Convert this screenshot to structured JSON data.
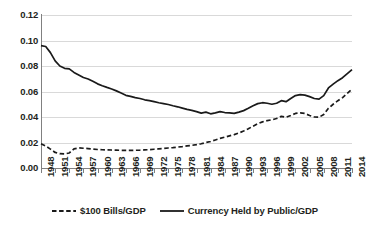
{
  "chart_data": {
    "type": "line",
    "title": "",
    "subtitle": "",
    "xlabel": "",
    "ylabel": "",
    "grid": true,
    "legend_position": "bottom",
    "xlim": [
      1948,
      2014
    ],
    "ylim": [
      0.0,
      0.12
    ],
    "ytick_labels": [
      "0.12",
      "0.10",
      "0.08",
      "0.06",
      "0.04",
      "0.02",
      "0.00"
    ],
    "ytick_values": [
      0.12,
      0.1,
      0.08,
      0.06,
      0.04,
      0.02,
      0.0
    ],
    "xtick_labels": [
      "1948",
      "1951",
      "1954",
      "1957",
      "1960",
      "1963",
      "1966",
      "1969",
      "1972",
      "1975",
      "1978",
      "1981",
      "1984",
      "1987",
      "1990",
      "1993",
      "1996",
      "1999",
      "2002",
      "2005",
      "2008",
      "2011",
      "2014"
    ],
    "xtick_values": [
      1948,
      1951,
      1954,
      1957,
      1960,
      1963,
      1966,
      1969,
      1972,
      1975,
      1978,
      1981,
      1984,
      1987,
      1990,
      1993,
      1996,
      1999,
      2002,
      2005,
      2008,
      2011,
      2014
    ],
    "x": [
      1948,
      1949,
      1950,
      1951,
      1952,
      1953,
      1954,
      1955,
      1956,
      1957,
      1958,
      1959,
      1960,
      1961,
      1962,
      1963,
      1964,
      1965,
      1966,
      1967,
      1968,
      1969,
      1970,
      1971,
      1972,
      1973,
      1974,
      1975,
      1976,
      1977,
      1978,
      1979,
      1980,
      1981,
      1982,
      1983,
      1984,
      1985,
      1986,
      1987,
      1988,
      1989,
      1990,
      1991,
      1992,
      1993,
      1994,
      1995,
      1996,
      1997,
      1998,
      1999,
      2000,
      2001,
      2002,
      2003,
      2004,
      2005,
      2006,
      2007,
      2008,
      2009,
      2010,
      2011,
      2012,
      2013,
      2014
    ],
    "series": [
      {
        "name": "Currency Held by Public/GDP",
        "style": "solid",
        "color": "#1a1a1a",
        "values": [
          0.096,
          0.0953,
          0.0905,
          0.084,
          0.08,
          0.0782,
          0.0778,
          0.075,
          0.073,
          0.071,
          0.0698,
          0.068,
          0.066,
          0.0645,
          0.0632,
          0.062,
          0.0605,
          0.0588,
          0.057,
          0.0562,
          0.0552,
          0.0545,
          0.0535,
          0.0528,
          0.052,
          0.0512,
          0.0505,
          0.0498,
          0.0488,
          0.048,
          0.047,
          0.046,
          0.0452,
          0.0442,
          0.043,
          0.0438,
          0.0425,
          0.0432,
          0.0442,
          0.0435,
          0.0432,
          0.0428,
          0.0438,
          0.045,
          0.0468,
          0.0488,
          0.0505,
          0.0512,
          0.0508,
          0.05,
          0.0508,
          0.0528,
          0.052,
          0.0545,
          0.0568,
          0.0575,
          0.0572,
          0.056,
          0.0545,
          0.054,
          0.0568,
          0.0628,
          0.0658,
          0.0685,
          0.0708,
          0.074,
          0.0772
        ]
      },
      {
        "name": "$100 Bills/GDP",
        "style": "dashed",
        "color": "#1a1a1a",
        "values": [
          0.019,
          0.0172,
          0.0148,
          0.0122,
          0.0112,
          0.011,
          0.0118,
          0.015,
          0.0158,
          0.0155,
          0.0152,
          0.0148,
          0.0145,
          0.0143,
          0.0142,
          0.0141,
          0.014,
          0.0139,
          0.0138,
          0.0138,
          0.0139,
          0.014,
          0.0142,
          0.0144,
          0.0147,
          0.015,
          0.0153,
          0.0157,
          0.016,
          0.0164,
          0.0168,
          0.0173,
          0.0178,
          0.0183,
          0.019,
          0.02,
          0.0208,
          0.022,
          0.0232,
          0.0242,
          0.0252,
          0.0262,
          0.0275,
          0.029,
          0.0308,
          0.0328,
          0.0348,
          0.0362,
          0.0372,
          0.0378,
          0.0388,
          0.0405,
          0.0398,
          0.0412,
          0.0428,
          0.0432,
          0.0428,
          0.0412,
          0.04,
          0.0398,
          0.042,
          0.0468,
          0.05,
          0.0528,
          0.0552,
          0.0585,
          0.0618
        ]
      }
    ]
  },
  "legend": {
    "items": [
      {
        "label": "$100 Bills/GDP",
        "style": "dashed"
      },
      {
        "label": "Currency Held by Public/GDP",
        "style": "solid"
      }
    ]
  },
  "colors": {
    "line": "#1a1a1a",
    "grid": "#d9d9d9",
    "axis": "#808080",
    "text": "#231f20",
    "background": "#ffffff"
  }
}
